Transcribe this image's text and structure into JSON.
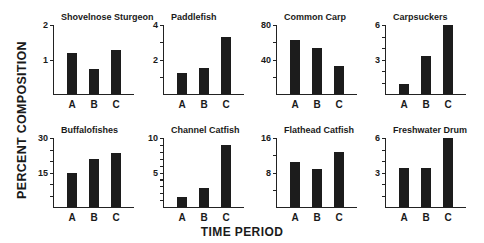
{
  "figure": {
    "ylabel": "PERCENT COMPOSITION",
    "xlabel": "TIME PERIOD"
  },
  "chart_data": [
    {
      "type": "bar",
      "title": "Shovelnose Sturgeon",
      "categories": [
        "A",
        "B",
        "C"
      ],
      "values": [
        1.2,
        0.72,
        1.28
      ],
      "ylim": [
        0,
        2
      ],
      "yticks": [
        1,
        2
      ],
      "ytick_labels": [
        "1",
        "2"
      ],
      "minor_ticks": [],
      "xlabel": "TIME PERIOD",
      "ylabel": "PERCENT COMPOSITION"
    },
    {
      "type": "bar",
      "title": "Paddlefish",
      "categories": [
        "A",
        "B",
        "C"
      ],
      "values": [
        1.2,
        1.5,
        3.3
      ],
      "ylim": [
        0,
        4
      ],
      "yticks": [
        2,
        4
      ],
      "ytick_labels": [
        "2",
        "4"
      ],
      "minor_ticks": [
        1,
        3
      ],
      "xlabel": "TIME PERIOD",
      "ylabel": "PERCENT COMPOSITION"
    },
    {
      "type": "bar",
      "title": "Common Carp",
      "categories": [
        "A",
        "B",
        "C"
      ],
      "values": [
        63,
        53,
        32
      ],
      "ylim": [
        0,
        80
      ],
      "yticks": [
        40,
        80
      ],
      "ytick_labels": [
        "40",
        "80"
      ],
      "minor_ticks": [
        20,
        60
      ],
      "xlabel": "TIME PERIOD",
      "ylabel": "PERCENT COMPOSITION"
    },
    {
      "type": "bar",
      "title": "Carpsuckers",
      "categories": [
        "A",
        "B",
        "C"
      ],
      "values": [
        0.9,
        3.3,
        6.0
      ],
      "ylim": [
        0,
        6
      ],
      "yticks": [
        3,
        6
      ],
      "ytick_labels": [
        "3",
        "6"
      ],
      "minor_ticks": [
        1,
        2,
        4,
        5
      ],
      "xlabel": "TIME PERIOD",
      "ylabel": "PERCENT COMPOSITION"
    },
    {
      "type": "bar",
      "title": "Buffalofishes",
      "categories": [
        "A",
        "B",
        "C"
      ],
      "values": [
        15,
        21,
        23.5
      ],
      "ylim": [
        0,
        30
      ],
      "yticks": [
        15,
        30
      ],
      "ytick_labels": [
        "15",
        "30"
      ],
      "minor_ticks": [
        5,
        10,
        20,
        25
      ],
      "xlabel": "TIME PERIOD",
      "ylabel": "PERCENT COMPOSITION"
    },
    {
      "type": "bar",
      "title": "Channel Catfish",
      "categories": [
        "A",
        "B",
        "C"
      ],
      "values": [
        1.5,
        2.8,
        9.0
      ],
      "ylim": [
        0,
        10
      ],
      "yticks": [
        5,
        10
      ],
      "ytick_labels": [
        "5",
        "10"
      ],
      "minor_ticks": [
        1,
        2,
        3,
        4,
        6,
        7,
        8,
        9
      ],
      "xlabel": "TIME PERIOD",
      "ylabel": "PERCENT COMPOSITION"
    },
    {
      "type": "bar",
      "title": "Flathead Catfish",
      "categories": [
        "A",
        "B",
        "C"
      ],
      "values": [
        10.5,
        8.8,
        12.7
      ],
      "ylim": [
        0,
        16
      ],
      "yticks": [
        8,
        16
      ],
      "ytick_labels": [
        "8",
        "16"
      ],
      "minor_ticks": [
        4,
        12
      ],
      "xlabel": "TIME PERIOD",
      "ylabel": "PERCENT COMPOSITION"
    },
    {
      "type": "bar",
      "title": "Freshwater Drum",
      "categories": [
        "A",
        "B",
        "C"
      ],
      "values": [
        3.4,
        3.4,
        6.0
      ],
      "ylim": [
        0,
        6
      ],
      "yticks": [
        3,
        6
      ],
      "ytick_labels": [
        "3",
        "6"
      ],
      "minor_ticks": [
        1,
        2,
        4,
        5
      ],
      "xlabel": "TIME PERIOD",
      "ylabel": "PERCENT COMPOSITION"
    }
  ],
  "layout": {
    "panel_positions": [
      [
        53,
        12
      ],
      [
        163,
        12
      ],
      [
        276,
        12
      ],
      [
        385,
        12
      ],
      [
        53,
        125
      ],
      [
        163,
        125
      ],
      [
        276,
        125
      ],
      [
        385,
        125
      ]
    ],
    "bar_color": "#1c1c1c"
  }
}
